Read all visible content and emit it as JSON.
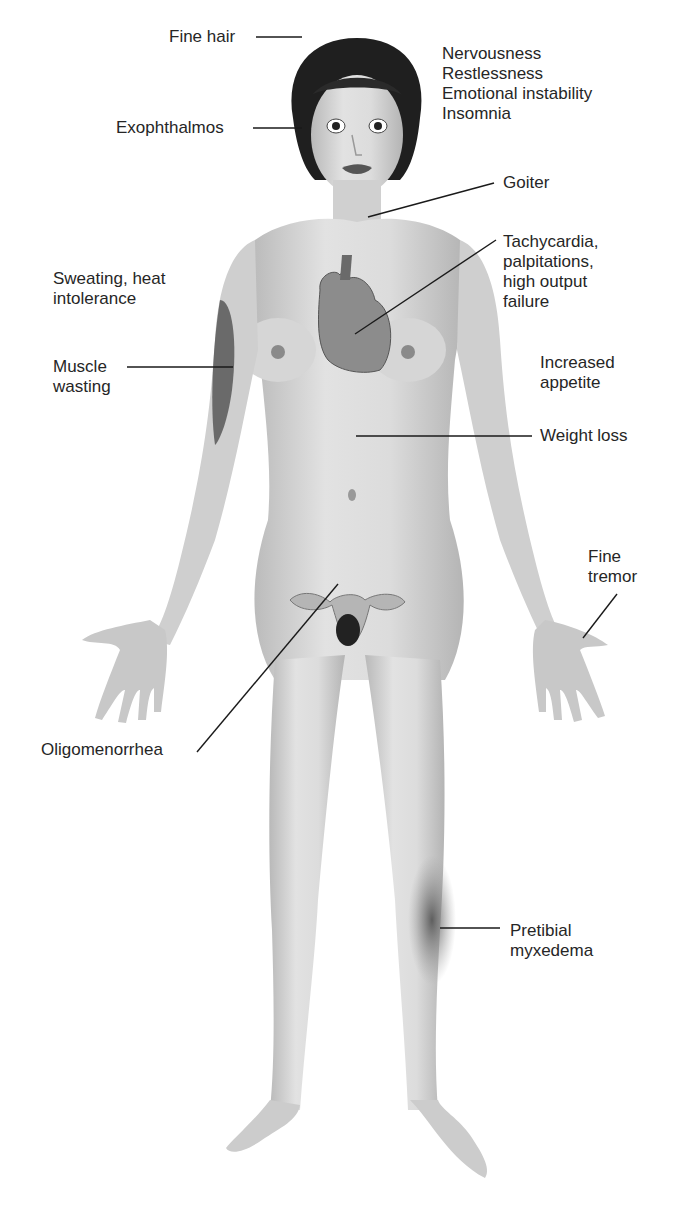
{
  "figure": {
    "skin_color": "#d4d4d4",
    "hair_color": "#1e1e1e",
    "muscle_color": "#6a6a6a",
    "heart_color": "#8a8a8a",
    "lesion_color": "#6e6e6e",
    "line_color": "#1a1a1a"
  },
  "labels": [
    {
      "id": "fine-hair",
      "lines": [
        "Fine hair"
      ],
      "x": 169,
      "y": 27
    },
    {
      "id": "exophthalmos",
      "lines": [
        "Exophthalmos"
      ],
      "x": 116,
      "y": 118
    },
    {
      "id": "neuro",
      "lines": [
        "Nervousness",
        "Restlessness",
        "Emotional instability",
        "Insomnia"
      ],
      "x": 442,
      "y": 44
    },
    {
      "id": "goiter",
      "lines": [
        "Goiter"
      ],
      "x": 503,
      "y": 173
    },
    {
      "id": "cardiac",
      "lines": [
        "Tachycardia,",
        "palpitations,",
        "high output",
        "failure"
      ],
      "x": 503,
      "y": 232
    },
    {
      "id": "sweating",
      "lines": [
        "Sweating, heat",
        "intolerance"
      ],
      "x": 53,
      "y": 269
    },
    {
      "id": "muscle",
      "lines": [
        "Muscle",
        "wasting"
      ],
      "x": 53,
      "y": 357
    },
    {
      "id": "appetite",
      "lines": [
        "Increased",
        "appetite"
      ],
      "x": 540,
      "y": 353
    },
    {
      "id": "weight",
      "lines": [
        "Weight loss"
      ],
      "x": 540,
      "y": 426
    },
    {
      "id": "tremor",
      "lines": [
        "Fine",
        "tremor"
      ],
      "x": 588,
      "y": 547
    },
    {
      "id": "oligo",
      "lines": [
        "Oligomenorrhea"
      ],
      "x": 41,
      "y": 740
    },
    {
      "id": "myxedema",
      "lines": [
        "Pretibial",
        "myxedema"
      ],
      "x": 510,
      "y": 921
    }
  ],
  "leaders": [
    {
      "id": "fine-hair",
      "x1": 256,
      "y1": 37,
      "x2": 302,
      "y2": 37
    },
    {
      "id": "exophthalmos",
      "x1": 253,
      "y1": 128,
      "x2": 302,
      "y2": 128
    },
    {
      "id": "goiter",
      "x1": 368,
      "y1": 217,
      "x2": 494,
      "y2": 183
    },
    {
      "id": "cardiac",
      "x1": 355,
      "y1": 334,
      "x2": 496,
      "y2": 240
    },
    {
      "id": "muscle",
      "x1": 127,
      "y1": 367,
      "x2": 233,
      "y2": 367
    },
    {
      "id": "weight",
      "x1": 356,
      "y1": 436,
      "x2": 532,
      "y2": 436
    },
    {
      "id": "tremor",
      "x1": 583,
      "y1": 638,
      "x2": 617,
      "y2": 594
    },
    {
      "id": "oligo",
      "x1": 197,
      "y1": 752,
      "x2": 338,
      "y2": 584
    },
    {
      "id": "myxedema",
      "x1": 440,
      "y1": 928,
      "x2": 500,
      "y2": 928
    }
  ]
}
